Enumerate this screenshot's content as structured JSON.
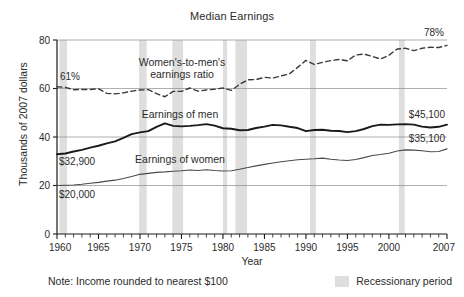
{
  "chart_data": {
    "type": "line",
    "title": "Median Earnings",
    "xlabel": "Year",
    "ylabel": "Thousands of 2007 dollars",
    "xlim": [
      1960,
      2007
    ],
    "ylim": [
      0,
      80
    ],
    "grid": "horizontal",
    "y_ticks": [
      "0",
      "20",
      "40",
      "60",
      "80"
    ],
    "y_tick_values": [
      0,
      20,
      40,
      60,
      80
    ],
    "x_ticks": [
      "1960",
      "1965",
      "1970",
      "1975",
      "1980",
      "1985",
      "1990",
      "1995",
      "2000",
      "2007"
    ],
    "x_tick_values": [
      1960,
      1965,
      1970,
      1975,
      1980,
      1985,
      1990,
      1995,
      2000,
      2007
    ],
    "x_minor_tick_step": 1,
    "legend_position": "bottom-right",
    "x": [
      1960,
      1961,
      1962,
      1963,
      1964,
      1965,
      1966,
      1967,
      1968,
      1969,
      1970,
      1971,
      1972,
      1973,
      1974,
      1975,
      1976,
      1977,
      1978,
      1979,
      1980,
      1981,
      1982,
      1983,
      1984,
      1985,
      1986,
      1987,
      1988,
      1989,
      1990,
      1991,
      1992,
      1993,
      1994,
      1995,
      1996,
      1997,
      1998,
      1999,
      2000,
      2001,
      2002,
      2003,
      2004,
      2005,
      2006,
      2007
    ],
    "series": [
      {
        "name": "Earnings of men",
        "style": "solid-thick",
        "color": "#1a1a1a",
        "units": "thousands of 2007 dollars",
        "values": [
          32.9,
          33.2,
          34.0,
          34.7,
          35.6,
          36.4,
          37.4,
          38.2,
          39.6,
          41.2,
          41.9,
          42.4,
          44.2,
          45.6,
          44.6,
          44.4,
          44.6,
          44.9,
          45.3,
          44.7,
          43.6,
          43.4,
          42.8,
          42.9,
          43.7,
          44.3,
          45.0,
          44.8,
          44.2,
          43.7,
          42.4,
          42.9,
          43.0,
          42.6,
          42.5,
          42.0,
          42.4,
          43.3,
          44.5,
          45.1,
          45.0,
          45.2,
          45.3,
          45.1,
          44.3,
          43.9,
          44.2,
          45.1
        ]
      },
      {
        "name": "Earnings of women",
        "style": "solid-thin",
        "color": "#4a4a4a",
        "units": "thousands of 2007 dollars",
        "values": [
          20.0,
          20.1,
          20.2,
          20.5,
          20.9,
          21.3,
          21.8,
          22.2,
          22.9,
          23.7,
          24.6,
          25.0,
          25.4,
          25.6,
          25.9,
          26.1,
          26.4,
          26.2,
          26.5,
          26.2,
          26.0,
          26.1,
          26.7,
          27.4,
          28.1,
          28.7,
          29.3,
          29.8,
          30.2,
          30.6,
          30.8,
          31.0,
          31.3,
          30.8,
          30.5,
          30.3,
          30.7,
          31.5,
          32.4,
          32.8,
          33.3,
          34.2,
          34.7,
          34.6,
          34.3,
          33.9,
          34.0,
          35.1
        ]
      },
      {
        "name": "Women's-to-men's earnings ratio",
        "style": "dashed",
        "color": "#3a3a3a",
        "units": "percent",
        "values": [
          60.7,
          60.5,
          59.5,
          59.6,
          59.6,
          59.9,
          58.0,
          57.8,
          58.2,
          58.9,
          59.4,
          59.5,
          57.9,
          56.6,
          58.8,
          58.8,
          60.2,
          58.9,
          59.4,
          59.7,
          60.2,
          59.2,
          61.7,
          63.6,
          63.7,
          64.6,
          64.3,
          65.2,
          66.0,
          68.7,
          71.6,
          69.9,
          70.8,
          71.5,
          72.0,
          71.4,
          73.8,
          74.2,
          73.2,
          72.2,
          73.7,
          76.3,
          76.6,
          75.6,
          76.6,
          77.0,
          76.9,
          77.8
        ]
      }
    ],
    "annotations": [
      {
        "name": "ratio-start-label",
        "text": "61%",
        "x": 1960,
        "y": 61,
        "series": "ratio"
      },
      {
        "name": "ratio-end-label",
        "text": "78%",
        "x": 2007,
        "y": 78,
        "series": "ratio"
      },
      {
        "name": "men-start-label",
        "text": "$32,900",
        "x": 1960,
        "y": 32.9,
        "series": "men"
      },
      {
        "name": "men-end-label",
        "text": "$45,100",
        "x": 2007,
        "y": 45.1,
        "series": "men"
      },
      {
        "name": "women-start-label",
        "text": "$20,000",
        "x": 1960,
        "y": 20.0,
        "series": "women"
      },
      {
        "name": "women-end-label",
        "text": "$35,100",
        "x": 2007,
        "y": 35.1,
        "series": "women"
      },
      {
        "name": "ratio-series-label",
        "text_line1": "Women's-to-men's",
        "text_line2": "earnings ratio"
      },
      {
        "name": "men-series-label",
        "text": "Earnings of men"
      },
      {
        "name": "women-series-label",
        "text": "Earnings of women"
      }
    ],
    "recession_bands": [
      {
        "start": 1960.3,
        "end": 1961.2
      },
      {
        "start": 1969.9,
        "end": 1970.8
      },
      {
        "start": 1973.9,
        "end": 1975.2
      },
      {
        "start": 1980.0,
        "end": 1980.5
      },
      {
        "start": 1981.5,
        "end": 1982.9
      },
      {
        "start": 1990.5,
        "end": 1991.2
      },
      {
        "start": 2001.2,
        "end": 2001.9
      }
    ],
    "recession_band_color": "#dededd",
    "note": "Note: Income rounded to nearest $100",
    "legend": [
      {
        "label": "Recessionary period",
        "swatch_color": "#dededd"
      }
    ]
  }
}
